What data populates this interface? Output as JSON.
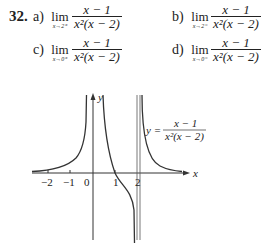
{
  "problem": {
    "number": "32.",
    "parts": [
      {
        "label": "a)",
        "lim_word": "lim",
        "sub": "x→2⁺",
        "numerator": "x − 1",
        "denominator": "x²(x − 2)"
      },
      {
        "label": "b)",
        "lim_word": "lim",
        "sub": "x→2⁻",
        "numerator": "x − 1",
        "denominator": "x²(x − 2)"
      },
      {
        "label": "c)",
        "lim_word": "lim",
        "sub": "x→0⁺",
        "numerator": "x − 1",
        "denominator": "x²(x − 2)"
      },
      {
        "label": "d)",
        "lim_word": "lim",
        "sub": "x→0⁻",
        "numerator": "x − 1",
        "denominator": "x²(x − 2)"
      }
    ]
  },
  "graph": {
    "y_axis_label": "y",
    "x_axis_label": "x",
    "equation_lhs": "y =",
    "equation_num": "x − 1",
    "equation_den": "x²(x − 2)",
    "ticks": [
      "−2",
      "−1",
      "0",
      "1",
      "2"
    ],
    "asymptotes": [
      "x = 0",
      "x = 2"
    ]
  }
}
